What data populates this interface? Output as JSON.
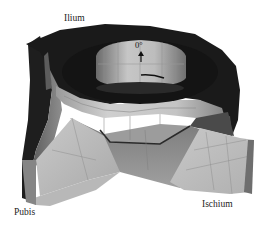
{
  "figure": {
    "labels": {
      "ilium": "Ilium",
      "pubis": "Pubis",
      "ischium": "Ischium",
      "angle_marker": "0°"
    },
    "colors": {
      "background": "#ffffff",
      "dark_surface": "#1c1c1c",
      "mid_surface": "#6e6e6e",
      "light_surface": "#bdbdbd",
      "highlight_surface": "#d6d6d6",
      "edge_line": "#8a8a8a"
    }
  }
}
